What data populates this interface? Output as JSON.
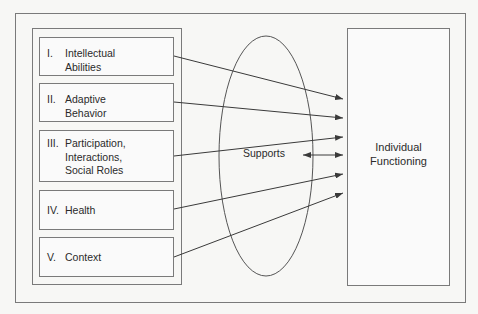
{
  "diagram": {
    "dimensions": [
      {
        "numeral": "I.",
        "label": "Intellectual\nAbilities"
      },
      {
        "numeral": "II.",
        "label": "Adaptive\nBehavior"
      },
      {
        "numeral": "III.",
        "label": "Participation,\nInteractions,\nSocial Roles"
      },
      {
        "numeral": "IV.",
        "label": "Health"
      },
      {
        "numeral": "V.",
        "label": "Context"
      }
    ],
    "center": {
      "label": "Supports"
    },
    "target": {
      "label": "Individual\nFunctioning"
    },
    "colors": {
      "line": "#3a3a3a",
      "border": "#7a7a7a",
      "background": "#f7f7f5"
    }
  }
}
